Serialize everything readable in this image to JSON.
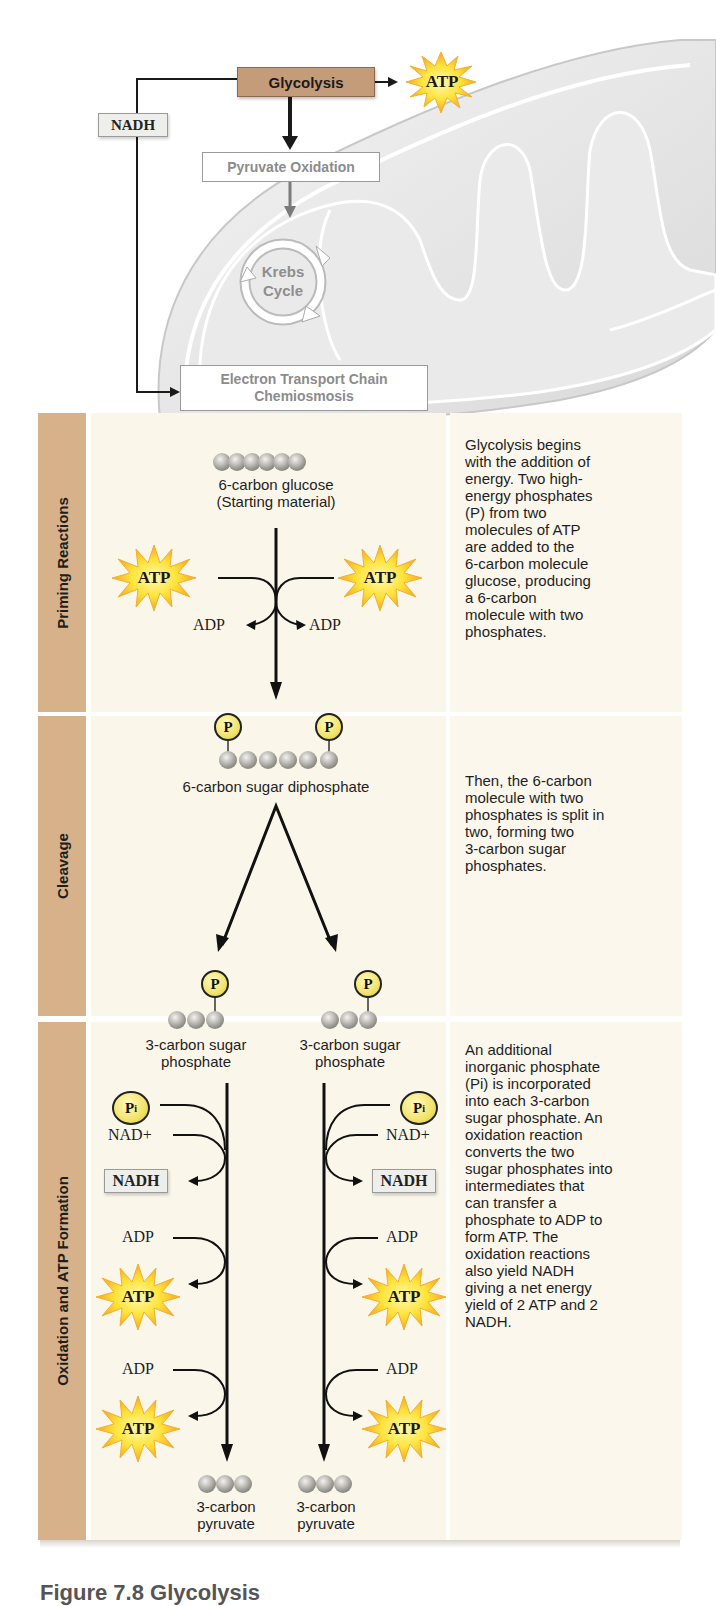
{
  "overview": {
    "glycolysis": "Glycolysis",
    "atp": "ATP",
    "nadh": "NADH",
    "pyruvate_oxidation": "Pyruvate Oxidation",
    "krebs_line1": "Krebs",
    "krebs_line2": "Cycle",
    "etc_line1": "Electron Transport Chain",
    "etc_line2": "Chemiosmosis"
  },
  "stages": [
    {
      "title": "Priming Reactions",
      "description": [
        "Glycolysis begins",
        "with the addition of",
        "energy. Two high-",
        "energy phosphates",
        "(P) from two",
        "molecules of ATP",
        "are added to the",
        "6-carbon molecule",
        "glucose, producing",
        "a 6-carbon",
        "molecule with two",
        "phosphates."
      ],
      "start_label_1": "6-carbon glucose",
      "start_label_2": "(Starting material)",
      "atp": "ATP",
      "adp": "ADP",
      "phosphate": "P"
    },
    {
      "title": "Cleavage",
      "description": [
        "Then, the 6-carbon",
        "molecule with two",
        "phosphates is split in",
        "two, forming two",
        "3-carbon sugar",
        "phosphates."
      ],
      "input_label": "6-carbon sugar diphosphate",
      "phosphate": "P"
    },
    {
      "title": "Oxidation and ATP Formation",
      "description": [
        "An additional",
        "inorganic phosphate",
        "(Pi) is incorporated",
        "into each 3-carbon",
        "sugar phosphate. An",
        "oxidation reaction",
        "converts the two",
        "sugar phosphates into",
        "intermediates that",
        "can transfer a",
        "phosphate to ADP to",
        "form ATP. The",
        "oxidation reactions",
        "also yield NADH",
        "giving a net energy",
        "yield of 2 ATP and 2",
        "NADH."
      ],
      "input_label_1": "3-carbon sugar",
      "input_label_2": "phosphate",
      "pi": "P",
      "pi_sub": "i",
      "nad_plus": "NAD+",
      "nadh": "NADH",
      "adp": "ADP",
      "atp": "ATP",
      "output_label_1": "3-carbon",
      "output_label_2": "pyruvate"
    }
  ],
  "caption": "Figure 7.8  Glycolysis"
}
